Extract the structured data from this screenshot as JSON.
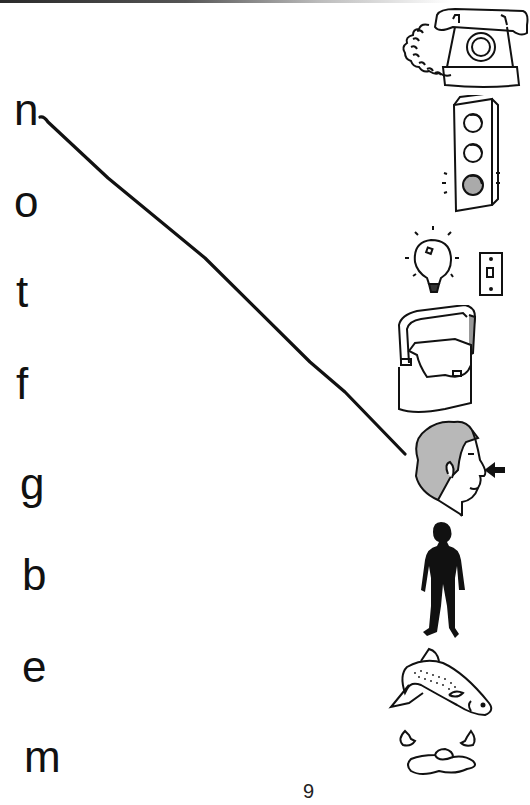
{
  "page": {
    "number": "9",
    "exercise": "Match each letter to the picture that begins with its sound"
  },
  "letters": [
    {
      "char": "n",
      "top": 88
    },
    {
      "char": "o",
      "top": 180
    },
    {
      "char": "t",
      "top": 270
    },
    {
      "char": "f",
      "top": 362
    },
    {
      "char": "g",
      "top": 462
    },
    {
      "char": "b",
      "top": 553
    },
    {
      "char": "e",
      "top": 645
    },
    {
      "char": "m",
      "top": 735
    }
  ],
  "pictures": [
    {
      "name": "telephone",
      "label": "telephone"
    },
    {
      "name": "traffic-light",
      "label": "traffic light"
    },
    {
      "name": "light-bulb-and-switch",
      "label": "light bulb and switch"
    },
    {
      "name": "bag",
      "label": "bag"
    },
    {
      "name": "head-nose",
      "label": "head with arrow pointing to nose"
    },
    {
      "name": "body-silhouette",
      "label": "body"
    },
    {
      "name": "fish",
      "label": "fish"
    },
    {
      "name": "egg",
      "label": "egg"
    }
  ],
  "drawn_connections": [
    {
      "from_letter": "n",
      "to_picture": "nose",
      "x1": 40,
      "y1": 117,
      "x2": 405,
      "y2": 454
    }
  ],
  "colors": {
    "ink": "#111111",
    "gray_fill": "#b8b8b8",
    "paper": "#ffffff"
  }
}
